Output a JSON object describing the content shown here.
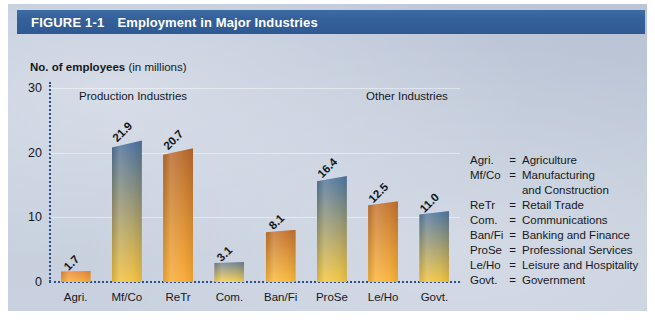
{
  "figure": {
    "number": "FIGURE 1-1",
    "title": "Employment in Major Industries",
    "titlebar_color": "#35619b",
    "panel_color": "#c6cfde"
  },
  "axis": {
    "y_label_strong": "No. of employees",
    "y_label_rest": " (in millions)",
    "y_ticks": [
      "30",
      "20",
      "10",
      "0"
    ]
  },
  "groups": {
    "production": "Production Industries",
    "other": "Other Industries"
  },
  "legend": [
    {
      "abbr": "Agri.",
      "eq": "=",
      "name": "Agriculture",
      "cont": ""
    },
    {
      "abbr": "Mf/Co",
      "eq": "=",
      "name": "Manufacturing",
      "cont": "and Construction"
    },
    {
      "abbr": "ReTr",
      "eq": "=",
      "name": "Retail Trade",
      "cont": ""
    },
    {
      "abbr": "Com.",
      "eq": "=",
      "name": "Communications",
      "cont": ""
    },
    {
      "abbr": "Ban/Fi",
      "eq": "=",
      "name": "Banking and Finance",
      "cont": ""
    },
    {
      "abbr": "ProSe",
      "eq": "=",
      "name": "Professional Services",
      "cont": ""
    },
    {
      "abbr": "Le/Ho",
      "eq": "=",
      "name": "Leisure and Hospitality",
      "cont": ""
    },
    {
      "abbr": "Govt.",
      "eq": "=",
      "name": "Government",
      "cont": ""
    }
  ],
  "chart_data": {
    "type": "bar",
    "title": "Employment in Major Industries",
    "xlabel": "",
    "ylabel": "No. of employees (in millions)",
    "ylim": [
      0,
      30
    ],
    "yticks": [
      0,
      10,
      20,
      30
    ],
    "grid": true,
    "legend_position": "right",
    "categories": [
      "Agri.",
      "Mf/Co",
      "ReTr",
      "Com.",
      "Ban/Fi",
      "ProSe",
      "Le/Ho",
      "Govt."
    ],
    "values": [
      1.7,
      21.9,
      20.7,
      3.1,
      8.1,
      16.4,
      12.5,
      11.0
    ],
    "value_labels": [
      "1.7",
      "21.9",
      "20.7",
      "3.1",
      "8.1",
      "16.4",
      "12.5",
      "11.0"
    ],
    "bar_colors_top": [
      "#e8863a",
      "#4a6f9e",
      "#b5682c",
      "#6d7f93",
      "#c1702f",
      "#4e74a0",
      "#c2712f",
      "#4f75a1"
    ],
    "bar_colors_bottom": [
      "#f6b03c",
      "#f2c13e",
      "#f9ab35",
      "#f7cf52",
      "#faba3c",
      "#f3c63f",
      "#fab43a",
      "#f1c43f"
    ],
    "annotations": [
      {
        "text": "Production Industries",
        "categories": [
          "Agri.",
          "Mf/Co",
          "ReTr"
        ]
      },
      {
        "text": "Other Industries",
        "categories": [
          "Com.",
          "Ban/Fi",
          "ProSe",
          "Le/Ho",
          "Govt."
        ]
      }
    ]
  }
}
